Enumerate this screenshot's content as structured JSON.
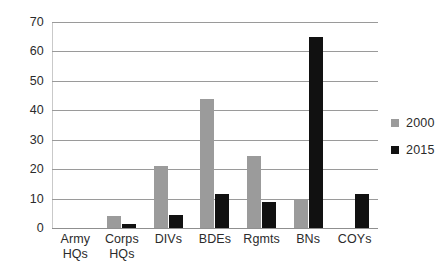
{
  "chart_data": {
    "type": "bar",
    "title": "",
    "subtitle": "",
    "xlabel": "",
    "ylabel": "",
    "categories": [
      "Army HQs",
      "Corps HQs",
      "DIVs",
      "BDEs",
      "Rgmts",
      "BNs",
      "COYs"
    ],
    "category_lines": [
      [
        "Army",
        "HQs"
      ],
      [
        "Corps",
        "HQs"
      ],
      [
        "DIVs",
        ""
      ],
      [
        "BDEs",
        ""
      ],
      [
        "Rgmts",
        ""
      ],
      [
        "BNs",
        ""
      ],
      [
        "COYs",
        ""
      ]
    ],
    "series": [
      {
        "name": "2000",
        "color": "#9b9b9b",
        "values": [
          0,
          4,
          21,
          44,
          24.5,
          9.5,
          0
        ]
      },
      {
        "name": "2015",
        "color": "#111111",
        "values": [
          0,
          1.5,
          4.5,
          11.5,
          9,
          65,
          11.5
        ]
      }
    ],
    "ylim": [
      0,
      70
    ],
    "ytick_values": [
      0,
      10,
      20,
      30,
      40,
      50,
      60,
      70
    ],
    "ytick_labels": [
      "0",
      "10",
      "20",
      "30",
      "40",
      "50",
      "60",
      "70"
    ],
    "grid": true,
    "legend_position": "right",
    "legend_entries": [
      {
        "label": "2000",
        "color": "#9b9b9b"
      },
      {
        "label": "2015",
        "color": "#111111"
      }
    ],
    "colors": {
      "series_2000": "#9b9b9b",
      "series_2015": "#111111",
      "gridline": "#9a9a9a",
      "text": "#2b2b2b",
      "background": "#ffffff"
    }
  }
}
